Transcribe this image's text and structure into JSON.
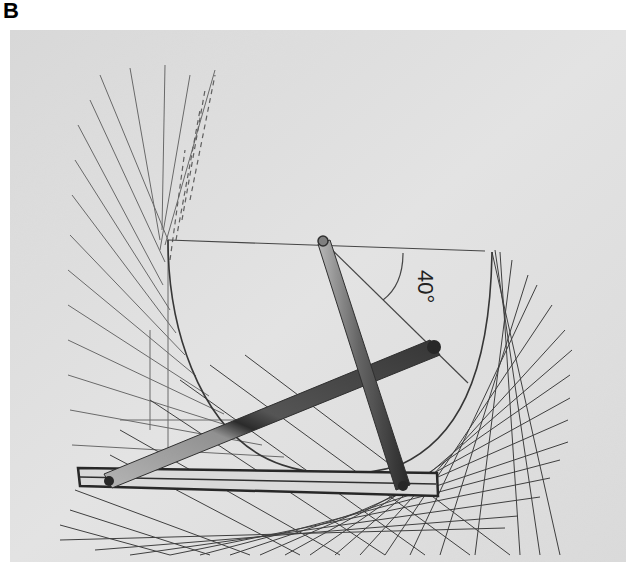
{
  "figure": {
    "panel_label": "B",
    "angle_label": "40°",
    "colors": {
      "background": "#ffffff",
      "paper": "#dcdcdc",
      "lines": "#3a3a3a",
      "bars_dark": "#1e1e1e",
      "bars_light": "#a8a8a8"
    }
  }
}
